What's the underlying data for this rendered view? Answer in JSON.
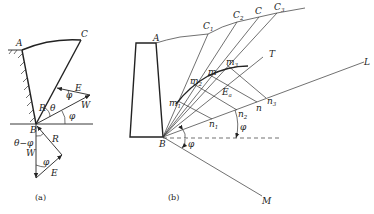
{
  "figure": {
    "panel_a": {
      "caption": "(a)",
      "points": {
        "A": "A",
        "B": "B",
        "C": "C"
      },
      "upper_triangle": {
        "E": "E",
        "W": "W",
        "R": "R",
        "theta": "θ",
        "phi1": "φ",
        "phi2": "φ"
      },
      "lower_triangle": {
        "W": "W",
        "R": "R",
        "E": "E",
        "phi": "φ",
        "theta_minus_phi": "θ−φ"
      }
    },
    "panel_b": {
      "caption": "(b)",
      "points": {
        "A": "A",
        "B": "B",
        "C1": "C",
        "C1_sub": "1",
        "C2": "C",
        "C2_sub": "2",
        "C": "C",
        "C3": "C",
        "C3_sub": "3"
      },
      "lines": {
        "T": "T",
        "L": "L",
        "M": "M"
      },
      "m_labels": [
        {
          "base": "m",
          "sub": "1"
        },
        {
          "base": "m",
          "sub": "2"
        },
        {
          "base": "m",
          "sub": ""
        },
        {
          "base": "m",
          "sub": "3"
        }
      ],
      "n_labels": [
        {
          "base": "n",
          "sub": "1"
        },
        {
          "base": "n",
          "sub": "2"
        },
        {
          "base": "n",
          "sub": ""
        },
        {
          "base": "n",
          "sub": "3"
        }
      ],
      "Ea": {
        "base": "E",
        "sub": "a"
      },
      "phi_upper": "φ",
      "phi_lower": "φ"
    }
  }
}
